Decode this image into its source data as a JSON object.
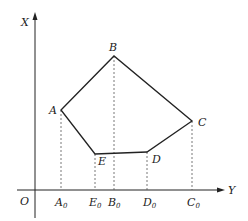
{
  "diagram": {
    "axes": {
      "vertical_label": "X",
      "horizontal_label": "Y",
      "origin_label": "O"
    },
    "points": [
      {
        "name": "A",
        "x": 61,
        "y": 110
      },
      {
        "name": "B",
        "x": 114,
        "y": 56
      },
      {
        "name": "C",
        "x": 192,
        "y": 121
      },
      {
        "name": "D",
        "x": 147,
        "y": 152
      },
      {
        "name": "E",
        "x": 95,
        "y": 154
      }
    ],
    "projections": [
      {
        "label": "A",
        "sub": "0"
      },
      {
        "label": "E",
        "sub": "0"
      },
      {
        "label": "B",
        "sub": "0"
      },
      {
        "label": "D",
        "sub": "0"
      },
      {
        "label": "C",
        "sub": "0"
      }
    ],
    "labels": {
      "A": "A",
      "B": "B",
      "C": "C",
      "D": "D",
      "E": "E"
    },
    "colors": {
      "stroke": "#222222",
      "dashed": "#555555"
    }
  }
}
